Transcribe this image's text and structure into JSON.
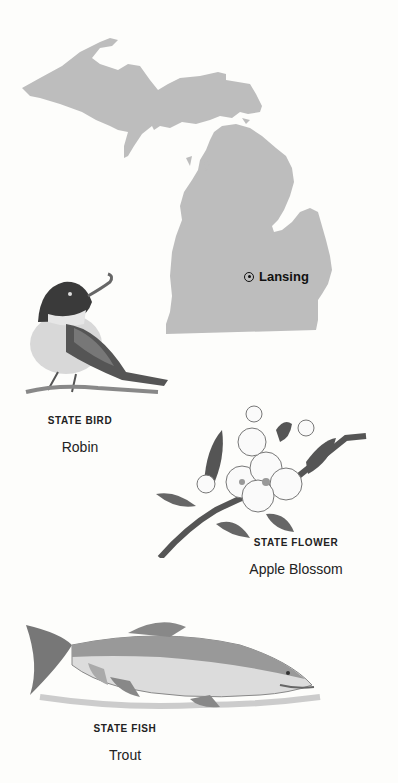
{
  "map": {
    "state_fill": "#bdbdbd",
    "capital": {
      "name": "Lansing",
      "icon": "capital-star-circle-icon"
    }
  },
  "symbols": [
    {
      "category": "STATE BIRD",
      "name": "Robin",
      "illustration": "robin-illustration"
    },
    {
      "category": "STATE FLOWER",
      "name": "Apple Blossom",
      "illustration": "apple-blossom-illustration"
    },
    {
      "category": "STATE FISH",
      "name": "Trout",
      "illustration": "trout-illustration"
    }
  ]
}
